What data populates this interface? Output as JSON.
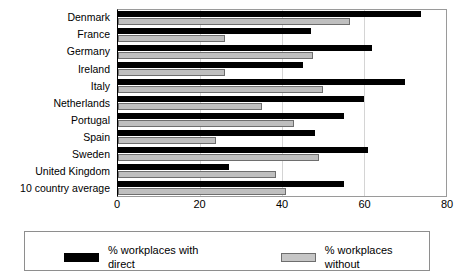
{
  "chart_data": {
    "type": "bar",
    "orientation": "horizontal",
    "title": "",
    "xlabel": "",
    "ylabel": "",
    "xlim": [
      0,
      80
    ],
    "xticks": [
      0,
      20,
      40,
      60,
      80
    ],
    "xtick_labels": [
      "0",
      "20",
      "40",
      "60",
      "80"
    ],
    "grid": true,
    "legend_position": "bottom",
    "categories": [
      "Denmark",
      "France",
      "Germany",
      "Ireland",
      "Italy",
      "Netherlands",
      "Portugal",
      "Spain",
      "Sweden",
      "United Kingdom",
      "10 country average"
    ],
    "series": [
      {
        "name": "% workplaces with direct",
        "color": "#000000",
        "values": [
          74,
          47,
          62,
          45,
          70,
          60,
          55,
          48,
          61,
          27,
          55
        ]
      },
      {
        "name": "% workplaces without",
        "color": "#bfbfbf",
        "values": [
          56.5,
          26,
          47.5,
          26,
          50,
          35,
          43,
          24,
          49,
          38.5,
          41
        ]
      }
    ]
  },
  "legend": {
    "entries": [
      {
        "label": "% workplaces with direct",
        "swatch": "black-bar-swatch"
      },
      {
        "label": "% workplaces without",
        "swatch": "gray-bar-swatch"
      }
    ]
  }
}
